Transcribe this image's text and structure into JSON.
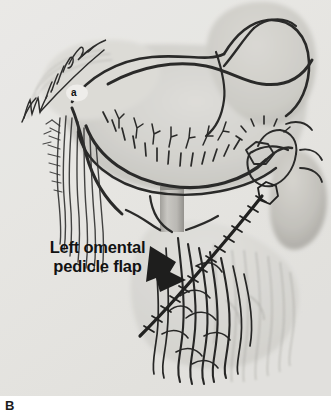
{
  "figure": {
    "panel_letter": "B",
    "annotation_lines": [
      "Left omental",
      "pedicle flap"
    ],
    "vessel_label": "a",
    "artist_signature": "Williams",
    "background_color": "#ededeb",
    "ink_color": "#1a1a1a",
    "arrow_color": "#0d0d0d"
  },
  "icons": {
    "pointer_arrow": "solid-arrowhead",
    "signature": "handwritten-signature"
  }
}
